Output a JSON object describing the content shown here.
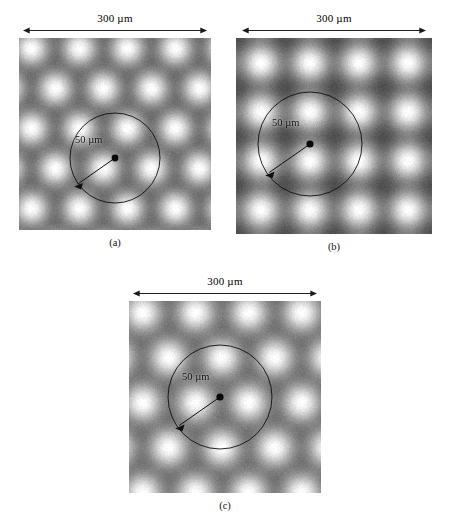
{
  "figure": {
    "scale_label": "300 µm",
    "radius_label": "50 µm"
  },
  "panels": [
    {
      "id": "a",
      "caption": "(a)",
      "scale_label": "300 µm",
      "radius_label": "50 µm",
      "lattice": "triangular",
      "plate_px": 192,
      "spot_spacing_px": 48,
      "rows": 6,
      "cols": 4,
      "row_offset_px": 24,
      "row_pitch_px": 40,
      "spot_radius_px": 15,
      "circle_center_px": [
        96,
        120
      ],
      "circle_radius_px": 45,
      "arrow_angle_deg": 215
    },
    {
      "id": "b",
      "caption": "(b)",
      "scale_label": "300 µm",
      "radius_label": "50 µm",
      "lattice": "square",
      "plate_px": 196,
      "spot_spacing_px": 49,
      "rows": 4,
      "cols": 4,
      "row_offset_px": 0,
      "row_pitch_px": 49,
      "spot_radius_px": 16,
      "circle_center_px": [
        74,
        106
      ],
      "circle_radius_px": 52,
      "arrow_angle_deg": 215
    },
    {
      "id": "c",
      "caption": "(c)",
      "scale_label": "300 µm",
      "radius_label": "50 µm",
      "lattice": "staggered-hex",
      "plate_px": 192,
      "spot_spacing_px": 53,
      "rows": 5,
      "cols": 4,
      "row_offset_px": 26,
      "row_pitch_px": 45,
      "spot_radius_px": 17,
      "circle_center_px": [
        91,
        96
      ],
      "circle_radius_px": 52,
      "arrow_angle_deg": 215
    }
  ],
  "chart_data": {
    "type": "heatmap",
    "title": "",
    "panels": [
      {
        "label": "(a)",
        "lattice_type": "triangular",
        "field_of_view_um": 300,
        "marker_radius_um": 50,
        "spot_count_approx": 24,
        "colormap": "gray",
        "value_range": [
          0,
          1
        ]
      },
      {
        "label": "(b)",
        "lattice_type": "square",
        "field_of_view_um": 300,
        "marker_radius_um": 50,
        "spot_count_approx": 16,
        "colormap": "gray",
        "value_range": [
          0,
          1
        ]
      },
      {
        "label": "(c)",
        "lattice_type": "staggered-hexagonal",
        "field_of_view_um": 300,
        "marker_radius_um": 50,
        "spot_count_approx": 18,
        "colormap": "gray",
        "value_range": [
          0,
          1
        ]
      }
    ],
    "xlabel": "",
    "ylabel": "",
    "legend": []
  }
}
